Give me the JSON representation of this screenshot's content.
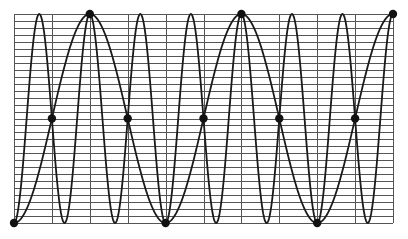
{
  "chart_data": {
    "type": "line",
    "title": "",
    "xlabel": "",
    "ylabel": "",
    "grid": true,
    "legend": null,
    "plot_area": {
      "left": 14,
      "top": 14,
      "right": 393,
      "bottom": 223
    },
    "grid_spec": {
      "vertical_divisions": 10,
      "horizontal_divisions": 30
    },
    "xlim": [
      0,
      2.5
    ],
    "ylim": [
      -1,
      1
    ],
    "series": [
      {
        "name": "wide-wave",
        "description": "low-frequency cosine: min at x=0, max at x=0.5, min at x=1, ...",
        "function": "-cos(2*pi*x)",
        "frequency": 1,
        "color": "#1a1a1a"
      },
      {
        "name": "narrow-wave",
        "description": "high-frequency cosine (3x frequency)",
        "function": "-cos(6*pi*x)",
        "frequency": 3,
        "color": "#1a1a1a"
      }
    ],
    "markers": [
      {
        "x": 0.0,
        "y": -1
      },
      {
        "x": 0.25,
        "y": 0
      },
      {
        "x": 0.5,
        "y": 1
      },
      {
        "x": 0.75,
        "y": 0
      },
      {
        "x": 1.0,
        "y": -1
      },
      {
        "x": 1.25,
        "y": 0
      },
      {
        "x": 1.5,
        "y": 1
      },
      {
        "x": 1.75,
        "y": 0
      },
      {
        "x": 2.0,
        "y": -1
      },
      {
        "x": 2.25,
        "y": 0
      },
      {
        "x": 2.5,
        "y": 1
      }
    ],
    "colors": {
      "grid": "#555555",
      "curve": "#1a1a1a",
      "marker": "#111111",
      "background": "#ffffff"
    }
  }
}
